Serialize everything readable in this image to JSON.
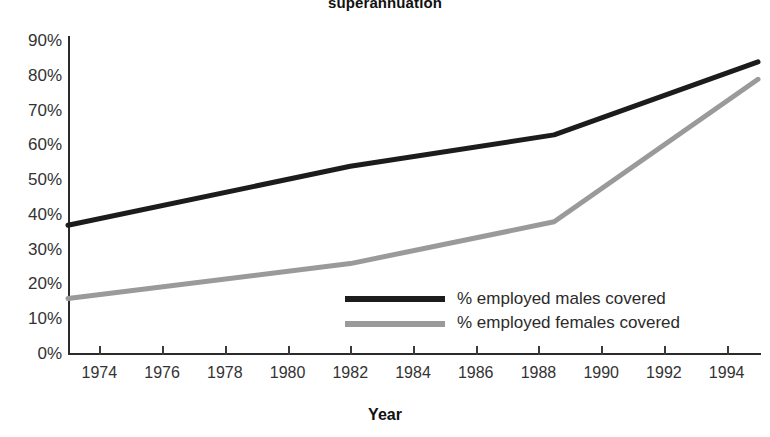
{
  "chart_data": {
    "type": "line",
    "title": "superannuation",
    "xlabel": "Year",
    "ylabel": "",
    "xlim": [
      1973,
      1995
    ],
    "ylim": [
      0,
      90
    ],
    "grid": false,
    "legend_position": "inside-bottom-right",
    "ytick_labels": [
      "90%",
      "80%",
      "70%",
      "60%",
      "50%",
      "40%",
      "30%",
      "20%",
      "10%",
      "0%"
    ],
    "ytick_values": [
      90,
      80,
      70,
      60,
      50,
      40,
      30,
      20,
      10,
      0
    ],
    "xtick_labels": [
      "1974",
      "1976",
      "1978",
      "1980",
      "1982",
      "1984",
      "1986",
      "1988",
      "1990",
      "1992",
      "1994"
    ],
    "xtick_values": [
      1974,
      1976,
      1978,
      1980,
      1982,
      1984,
      1986,
      1988,
      1990,
      1992,
      1994
    ],
    "series": [
      {
        "name": "% employed males covered",
        "color": "#1c1c1c",
        "x": [
          1973,
          1982,
          1988.5,
          1995
        ],
        "values": [
          37,
          54,
          63,
          84
        ]
      },
      {
        "name": "% employed females covered",
        "color": "#9a9a9a",
        "x": [
          1973,
          1982,
          1988.5,
          1995
        ],
        "values": [
          16,
          26,
          38,
          79
        ]
      }
    ]
  },
  "legend": {
    "items": [
      {
        "label": "% employed males covered",
        "color": "#1c1c1c"
      },
      {
        "label": "% employed females covered",
        "color": "#9a9a9a"
      }
    ]
  }
}
